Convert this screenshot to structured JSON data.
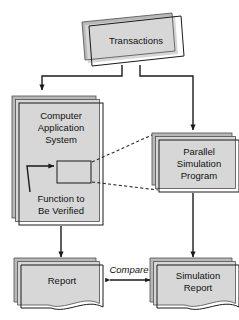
{
  "diagram": {
    "type": "flowchart",
    "background_color": "#ffffff",
    "line_color": "#1a1a1a",
    "shadow_color": "#b9b9b9",
    "nodes": {
      "transactions": {
        "label": "Transactions",
        "shape": "skewed-document-stack"
      },
      "computer_application_system": {
        "label_line1": "Computer",
        "label_line2": "Application",
        "label_line3": "System",
        "shape": "page-stack"
      },
      "function_box": {
        "label": "",
        "shape": "rectangle"
      },
      "function_caption": {
        "label_line1": "Function to",
        "label_line2": "Be Verified"
      },
      "parallel_simulation_program": {
        "label_line1": "Parallel",
        "label_line2": "Simulation",
        "label_line3": "Program",
        "shape": "page-stack"
      },
      "report": {
        "label": "Report",
        "shape": "document-stack"
      },
      "simulation_report": {
        "label_line1": "Simulation",
        "label_line2": "Report",
        "shape": "document-stack"
      }
    },
    "edges": {
      "compare_label": "Compare"
    }
  }
}
